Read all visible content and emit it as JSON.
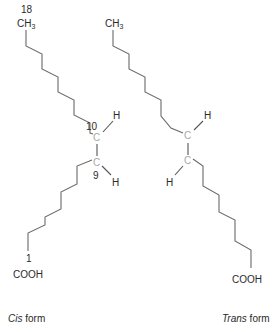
{
  "figure": {
    "type": "chemical-structure-comparison",
    "colors": {
      "bond": "#6a6a6a",
      "double_bond": "#8a8a8a",
      "carbon_label": "#a8a8a8",
      "text": "#2a2a2a",
      "background": "#ffffff"
    }
  },
  "cis": {
    "top_group": "CH",
    "top_group_sub": "3",
    "top_number": "18",
    "upper_carbon_number": "10",
    "lower_carbon_number": "9",
    "carbon_label": "C",
    "upper_h": "H",
    "lower_h": "H",
    "bottom_number": "1",
    "bottom_group": "COOH",
    "caption_italic": "Cis",
    "caption_rest": " form"
  },
  "trans": {
    "top_group": "CH",
    "top_group_sub": "3",
    "carbon_label": "C",
    "upper_h": "H",
    "lower_h": "H",
    "bottom_group": "COOH",
    "caption_italic": "Trans",
    "caption_rest": " form"
  }
}
